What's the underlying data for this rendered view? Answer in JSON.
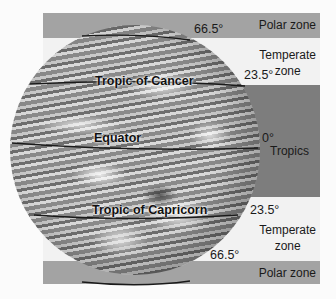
{
  "zones": [
    {
      "id": "polar-north",
      "label": "Polar zone",
      "color": "#a3a3a3"
    },
    {
      "id": "temperate-north",
      "label": "Temperate\nzone",
      "color": "#f2f2f2"
    },
    {
      "id": "tropics",
      "label": "Tropics",
      "color": "#7d7d7d"
    },
    {
      "id": "temperate-south",
      "label": "Temperate\nzone",
      "color": "#f2f2f2"
    },
    {
      "id": "polar-south",
      "label": "Polar zone",
      "color": "#a3a3a3"
    }
  ],
  "labels": {
    "polar_north": "Polar zone",
    "temperate_north_1": "Temperate",
    "temperate_north_2": "zone",
    "tropics": "Tropics",
    "temperate_south_1": "Temperate",
    "temperate_south_2": "zone",
    "polar_south": "Polar zone"
  },
  "latitude_lines": {
    "arctic_circle": "66.5°",
    "tropic_of_cancer": "Tropic of Cancer",
    "tropic_of_cancer_deg": "23.5°",
    "equator": "Equator",
    "equator_deg": "0°",
    "tropic_of_capricorn": "Tropic of Capricorn",
    "tropic_of_capricorn_deg": "23.5°",
    "antarctic_circle": "66.5°"
  }
}
